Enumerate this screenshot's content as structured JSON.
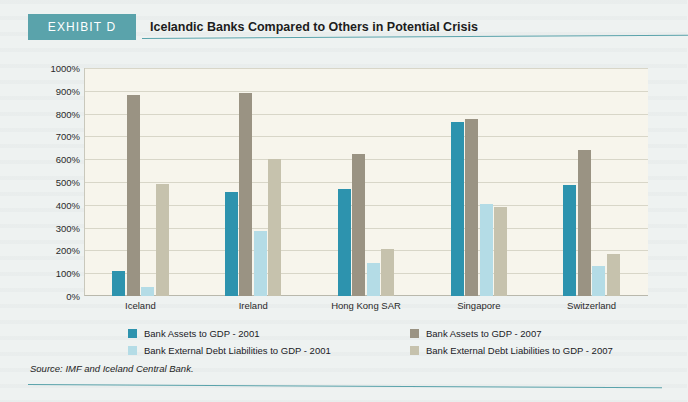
{
  "header": {
    "badge": "EXHIBIT D",
    "title": "Icelandic Banks Compared to Others in Potential Crisis"
  },
  "source": "Source: IMF and Iceland Central Bank.",
  "colors": {
    "accent_teal": "#5aa3ab",
    "assets_2001": "#2d93ae",
    "assets_2007": "#9a9383",
    "debt_2001": "#b4dce6",
    "debt_2007": "#c6c2ad",
    "plot_background": "#f7f5ec",
    "page_background": "#eef2f1"
  },
  "chart_data": {
    "type": "bar",
    "title": "Icelandic Banks Compared to Others in Potential Crisis",
    "xlabel": "",
    "ylabel": "",
    "categories": [
      "Iceland",
      "Ireland",
      "Hong Kong SAR",
      "Singapore",
      "Switzerland"
    ],
    "ylim": [
      0,
      1000
    ],
    "ytick_labels": [
      "0%",
      "100%",
      "200%",
      "300%",
      "400%",
      "500%",
      "600%",
      "700%",
      "800%",
      "900%",
      "1000%"
    ],
    "ytick_values": [
      0,
      100,
      200,
      300,
      400,
      500,
      600,
      700,
      800,
      900,
      1000
    ],
    "grid": true,
    "legend_position": "bottom",
    "series": [
      {
        "name": "Bank Assets to GDP - 2001",
        "color": "#2d93ae",
        "values": [
          110,
          455,
          470,
          765,
          485
        ]
      },
      {
        "name": "Bank Assets to GDP - 2007",
        "color": "#9a9383",
        "values": [
          880,
          890,
          625,
          775,
          640
        ]
      },
      {
        "name": "Bank External Debt Liabilities to GDP - 2001",
        "color": "#b4dce6",
        "values": [
          40,
          285,
          145,
          405,
          130
        ]
      },
      {
        "name": "Bank External Debt Liabilities to GDP - 2007",
        "color": "#c6c2ad",
        "values": [
          490,
          600,
          205,
          390,
          185
        ]
      }
    ]
  },
  "legend": [
    {
      "label": "Bank Assets to GDP - 2001",
      "color": "#2d93ae"
    },
    {
      "label": "Bank External Debt Liabilities to GDP - 2001",
      "color": "#b4dce6"
    },
    {
      "label": "Bank Assets to GDP - 2007",
      "color": "#9a9383"
    },
    {
      "label": "Bank External Debt Liabilities to GDP - 2007",
      "color": "#c6c2ad"
    }
  ]
}
